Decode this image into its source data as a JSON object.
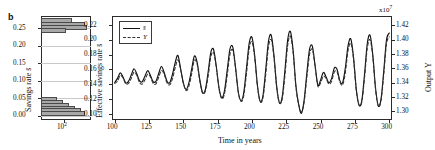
{
  "figure": {
    "panel_label": "b"
  },
  "histogram": {
    "ylabel": "Savings rate s̄",
    "ylabel_plain": "Savings rate",
    "xlabel_tick": "10",
    "xlabel_exp": "2",
    "y_ticks": [
      "0.25",
      "0.20",
      "0.15",
      "0.10",
      "0.05",
      "0.00"
    ],
    "y_tick_values": [
      0.25,
      0.2,
      0.15,
      0.1,
      0.05,
      0.0
    ],
    "ylim": [
      -0.012,
      0.285
    ],
    "xscale": "log",
    "xlim": [
      30,
      400
    ],
    "bars": [
      {
        "center": 0.272,
        "count": 150
      },
      {
        "center": 0.262,
        "count": 300
      },
      {
        "center": 0.252,
        "count": 320
      },
      {
        "center": 0.244,
        "count": 110
      },
      {
        "center": 0.046,
        "count": 70
      },
      {
        "center": 0.038,
        "count": 95
      },
      {
        "center": 0.03,
        "count": 130
      },
      {
        "center": 0.022,
        "count": 175
      },
      {
        "center": 0.014,
        "count": 235
      },
      {
        "center": 0.006,
        "count": 300
      }
    ]
  },
  "timeseries": {
    "xlabel": "Time in years",
    "left_ylabel": "Effective savings rate s̄",
    "left_ylabel_plain": "Effective savings rate",
    "right_ylabel": "Output Y",
    "right_multiplier": "x10",
    "right_multiplier_exp": "7",
    "x_ticks": [
      "100",
      "125",
      "150",
      "175",
      "200",
      "225",
      "250",
      "275",
      "300"
    ],
    "x_tick_values": [
      100,
      125,
      150,
      175,
      200,
      225,
      250,
      275,
      300
    ],
    "xlim": [
      98,
      302
    ],
    "left_y_ticks": [
      "0.22",
      "0.20",
      "0.18",
      "0.16",
      "0.14",
      "0.12",
      "0.10"
    ],
    "left_y_tick_values": [
      0.22,
      0.2,
      0.18,
      0.16,
      0.14,
      0.12,
      0.1
    ],
    "left_ylim": [
      0.092,
      0.232
    ],
    "right_y_ticks": [
      "1.42",
      "1.40",
      "1.38",
      "1.36",
      "1.34",
      "1.32",
      "1.30"
    ],
    "right_y_tick_values": [
      1.42,
      1.4,
      1.38,
      1.36,
      1.34,
      1.32,
      1.3
    ],
    "right_ylim": [
      1.288,
      1.433
    ],
    "legend": [
      {
        "label": "s̄",
        "style": "solid",
        "name": "effective-savings-rate"
      },
      {
        "label": "Y",
        "style": "dashed",
        "name": "output"
      }
    ],
    "colors": {
      "savings_line": "#111111",
      "output_line": "#333333",
      "frame": "#2b2b2b",
      "bar_fill": "#a8a8a8"
    }
  },
  "chart_data": [
    {
      "type": "bar",
      "orientation": "horizontal",
      "title": "",
      "xlabel": "",
      "ylabel": "Savings rate s̄",
      "xscale": "log",
      "xlim": [
        30,
        400
      ],
      "ylim": [
        -0.012,
        0.285
      ],
      "x_tick_labels": [
        "10^2"
      ],
      "categories": [
        0.272,
        0.262,
        0.252,
        0.244,
        0.046,
        0.038,
        0.03,
        0.022,
        0.014,
        0.006
      ],
      "values": [
        150,
        300,
        320,
        110,
        70,
        95,
        130,
        175,
        235,
        300
      ],
      "grid": true,
      "legend": "none",
      "note": "Histogram of savings rate occurrences; two clusters near 0.25-0.27 and 0.00-0.05"
    },
    {
      "type": "line",
      "title": "",
      "xlabel": "Time in years",
      "ylabel": "Effective savings rate s̄",
      "y2label": "Output Y",
      "y2_multiplier": 10000000.0,
      "xlim": [
        98,
        302
      ],
      "ylim": [
        0.092,
        0.232
      ],
      "y2lim": [
        1.288,
        1.433
      ],
      "grid": false,
      "legend": "upper left",
      "x": [
        100,
        102,
        104,
        106,
        108,
        110,
        112,
        114,
        116,
        118,
        120,
        122,
        124,
        126,
        128,
        130,
        132,
        134,
        136,
        138,
        140,
        142,
        144,
        146,
        148,
        150,
        152,
        154,
        156,
        158,
        160,
        162,
        164,
        166,
        168,
        170,
        172,
        174,
        176,
        178,
        180,
        182,
        184,
        186,
        188,
        190,
        192,
        194,
        196,
        198,
        200,
        202,
        204,
        206,
        208,
        210,
        212,
        214,
        216,
        218,
        220,
        222,
        224,
        226,
        228,
        230,
        232,
        234,
        236,
        238,
        240,
        242,
        244,
        246,
        248,
        250,
        252,
        254,
        256,
        258,
        260,
        262,
        264,
        266,
        268,
        270,
        272,
        274,
        276,
        278,
        280,
        282,
        284,
        286,
        288,
        290,
        292,
        294,
        296,
        298,
        300
      ],
      "series": [
        {
          "name": "s̄",
          "axis": "left",
          "style": "solid",
          "values": [
            0.1425,
            0.148,
            0.1555,
            0.15,
            0.142,
            0.144,
            0.1525,
            0.161,
            0.1545,
            0.145,
            0.1435,
            0.151,
            0.1585,
            0.152,
            0.1435,
            0.144,
            0.1545,
            0.164,
            0.156,
            0.1445,
            0.142,
            0.153,
            0.169,
            0.179,
            0.161,
            0.142,
            0.133,
            0.142,
            0.16,
            0.178,
            0.17,
            0.146,
            0.129,
            0.133,
            0.156,
            0.183,
            0.187,
            0.164,
            0.135,
            0.122,
            0.132,
            0.16,
            0.188,
            0.19,
            0.163,
            0.13,
            0.118,
            0.129,
            0.162,
            0.196,
            0.203,
            0.178,
            0.138,
            0.117,
            0.125,
            0.16,
            0.198,
            0.206,
            0.179,
            0.137,
            0.115,
            0.123,
            0.159,
            0.2,
            0.211,
            0.185,
            0.138,
            0.113,
            0.101,
            0.119,
            0.156,
            0.188,
            0.191,
            0.165,
            0.139,
            0.146,
            0.156,
            0.15,
            0.142,
            0.148,
            0.162,
            0.16,
            0.145,
            0.142,
            0.162,
            0.192,
            0.201,
            0.176,
            0.133,
            0.112,
            0.118,
            0.154,
            0.195,
            0.206,
            0.18,
            0.135,
            0.111,
            0.12,
            0.158,
            0.2,
            0.209
          ]
        },
        {
          "name": "Y",
          "axis": "right",
          "style": "dashed",
          "values": [
            1.339,
            1.342,
            1.35,
            1.347,
            1.3385,
            1.339,
            1.346,
            1.3545,
            1.3505,
            1.3405,
            1.338,
            1.344,
            1.352,
            1.348,
            1.339,
            1.3385,
            1.3475,
            1.357,
            1.352,
            1.34,
            1.337,
            1.345,
            1.3605,
            1.372,
            1.358,
            1.339,
            1.329,
            1.335,
            1.352,
            1.371,
            1.366,
            1.342,
            1.3255,
            1.328,
            1.348,
            1.376,
            1.382,
            1.361,
            1.331,
            1.3175,
            1.325,
            1.351,
            1.38,
            1.385,
            1.36,
            1.3265,
            1.314,
            1.322,
            1.353,
            1.388,
            1.397,
            1.374,
            1.334,
            1.3135,
            1.319,
            1.351,
            1.39,
            1.4,
            1.375,
            1.333,
            1.312,
            1.317,
            1.35,
            1.392,
            1.405,
            1.381,
            1.334,
            1.31,
            1.299,
            1.313,
            1.348,
            1.38,
            1.386,
            1.362,
            1.335,
            1.34,
            1.349,
            1.346,
            1.338,
            1.342,
            1.355,
            1.355,
            1.341,
            1.337,
            1.354,
            1.385,
            1.395,
            1.372,
            1.329,
            1.309,
            1.313,
            1.347,
            1.388,
            1.4,
            1.376,
            1.331,
            1.308,
            1.315,
            1.351,
            1.394,
            1.404
          ]
        }
      ]
    }
  ]
}
